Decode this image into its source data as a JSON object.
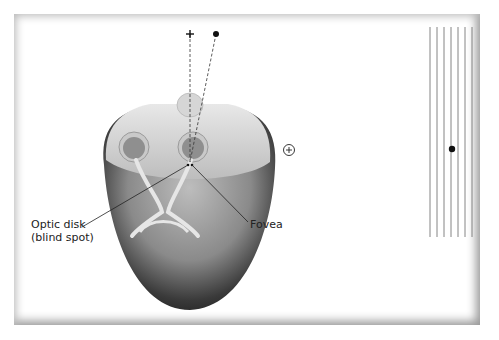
{
  "labels": {
    "optic_disk_line1": "Optic disk",
    "optic_disk_line2": "(blind spot)",
    "fovea": "Fovea"
  },
  "targets": {
    "cross": "+",
    "dot": "●",
    "circled_plus": "⊕",
    "line_count": 7
  }
}
